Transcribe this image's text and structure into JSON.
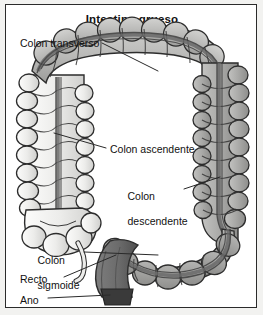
{
  "figure": {
    "title": "Intestino grueso",
    "language": "es"
  },
  "labels": {
    "transverse": "Colon transverso",
    "ascending": "Colon ascendente",
    "descending_line1": "Colon",
    "descending_line2": "descendente",
    "sigmoid_line1": "Colon",
    "sigmoid_line2": "sigmoide",
    "rectum": "Recto",
    "anus": "Ano"
  },
  "colors": {
    "page_background": "#f2f2f0",
    "panel_background": "#ffffff",
    "frame_border": "#2b2b2b",
    "text": "#111111",
    "leader_line": "#2a2a2a",
    "ascending_fill": "#e9e9e7",
    "transverse_fill": "#b9b9b7",
    "descending_fill": "#a9a9a7",
    "sigmoid_fill": "#9e9e9c",
    "rectum_fill": "#6b6b6b",
    "anus_fill": "#3a3a3a",
    "outline": "#2d2d2d",
    "taenia_band": "#555555"
  }
}
